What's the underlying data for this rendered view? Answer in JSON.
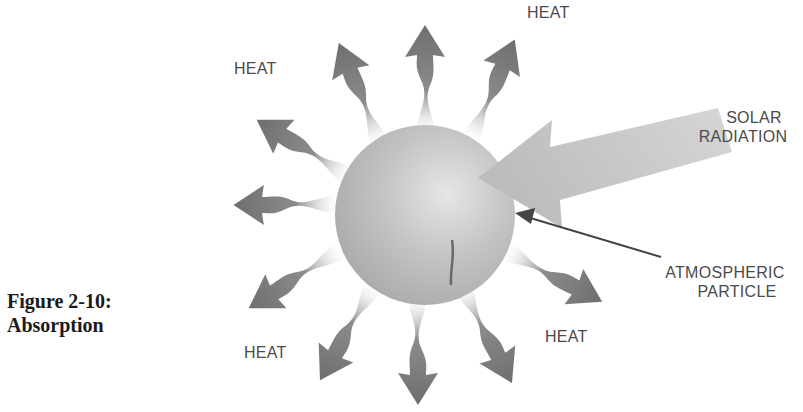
{
  "caption": {
    "line1": "Figure 2-10:",
    "line2": "Absorption"
  },
  "labels": {
    "heat_top_left": "HEAT",
    "heat_top_right": "HEAT",
    "heat_bottom_left": "HEAT",
    "heat_bottom_right": "HEAT",
    "solar_line1": "SOLAR",
    "solar_line2": "RADIATION",
    "particle_line1": "ATMOSPHERIC",
    "particle_line2": "PARTICLE"
  },
  "colors": {
    "particle_fill": "#bdbdbd",
    "heat_arrow": "#7a7a7a",
    "solar_arrow": "#c8c8c8",
    "pointer": "#444444",
    "text": "#4a4a4a"
  }
}
